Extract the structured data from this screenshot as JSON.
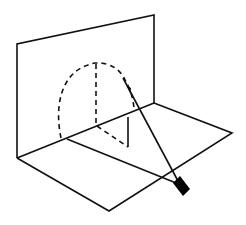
{
  "diagram": {
    "colors": {
      "stroke": "#111111",
      "source": "#000000",
      "background": "#ffffff"
    },
    "elements": {
      "vertical_plane": {
        "points": [
          [
            17,
            44
          ],
          [
            154,
            15
          ],
          [
            154,
            103
          ],
          [
            17,
            158
          ]
        ]
      },
      "horizontal_plane": {
        "points": [
          [
            17,
            158
          ],
          [
            109,
            211
          ],
          [
            232,
            133
          ],
          [
            154,
            103
          ]
        ]
      },
      "semicircle_dashed": {
        "start": [
          61,
          138
        ],
        "top": [
          95,
          63
        ],
        "end": [
          134,
          108
        ]
      },
      "vertical_radius_dashed": {
        "from": [
          96,
          63
        ],
        "to": [
          96,
          125
        ]
      },
      "floor_dashed_segment": {
        "from": [
          96,
          125
        ],
        "to": [
          128,
          147
        ]
      },
      "shadow_vertical_solid": {
        "from": [
          128,
          118
        ],
        "to": [
          128,
          147
        ]
      },
      "floor_ray_line": {
        "from": [
          67,
          139
        ],
        "to": [
          172,
          182
        ]
      },
      "light_ray": {
        "from": [
          123,
          78
        ],
        "to": [
          177,
          180
        ]
      },
      "light_source_box": {
        "points": [
          [
            173,
            183
          ],
          [
            180,
            176
          ],
          [
            190,
            189
          ],
          [
            183,
            196
          ]
        ]
      }
    }
  }
}
